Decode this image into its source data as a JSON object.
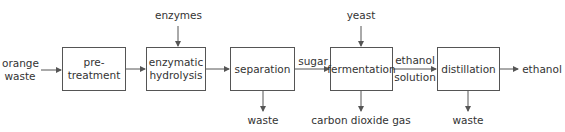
{
  "diagram": {
    "input": "orange\nwaste",
    "steps": [
      {
        "label": "pre-treatment"
      },
      {
        "label": "enzymatic hydrolysis"
      },
      {
        "label": "separation"
      },
      {
        "label": "fermentation"
      },
      {
        "label": "distillation"
      }
    ],
    "inputs_top": {
      "enzymes": "enzymes",
      "yeast": "yeast"
    },
    "flows": {
      "sugar": "sugar",
      "ethanol_solution_1": "ethanol",
      "ethanol_solution_2": "solution"
    },
    "outputs_bottom": {
      "separation_waste": "waste",
      "co2": "carbon dioxide gas",
      "distillation_waste": "waste"
    },
    "output": "ethanol",
    "input_line1": "orange",
    "input_line2": "waste",
    "hydrolysis_line1": "enzymatic",
    "hydrolysis_line2": "hydrolysis",
    "line_color": "#555555"
  }
}
